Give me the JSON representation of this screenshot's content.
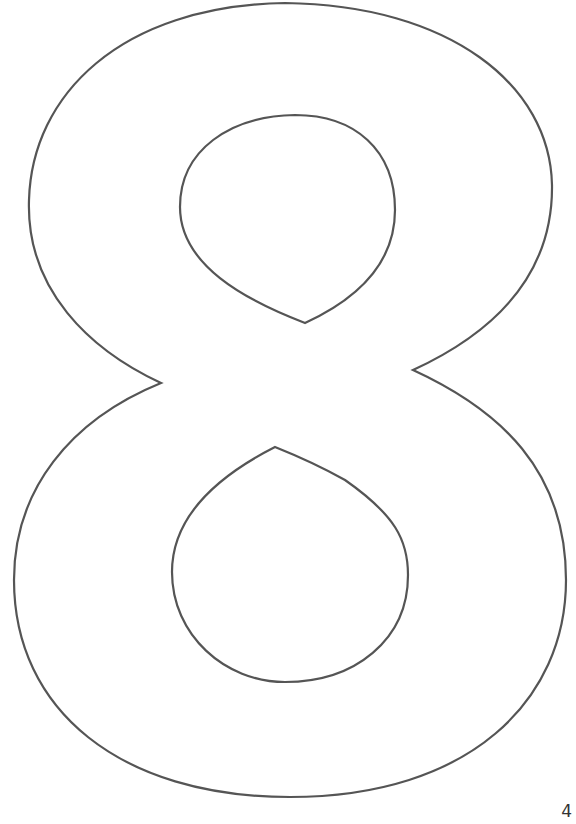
{
  "page": {
    "glyph": "8",
    "page_number": "4"
  },
  "style": {
    "stroke_color": "#555555",
    "fill_color": "#ffffff",
    "background": "#ffffff"
  }
}
